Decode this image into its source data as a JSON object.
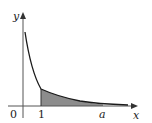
{
  "diagram": {
    "axes": {
      "x_label": "x",
      "y_label": "y",
      "origin_label": "0"
    },
    "ticks": {
      "one": "1",
      "a": "a"
    },
    "colors": {
      "curve": "#1a1a1a",
      "shade": "#8c8c8c",
      "axis": "#555555"
    }
  }
}
